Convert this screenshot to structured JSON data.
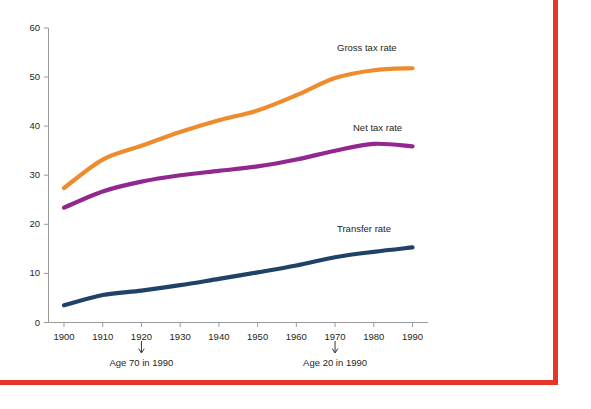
{
  "figure": {
    "cropped_title_fragment": "",
    "frame_color": "#e8352a",
    "background_color": "#ffffff"
  },
  "chart_data": {
    "type": "line",
    "title": "",
    "xlabel": "",
    "ylabel": "",
    "xlim": [
      1896,
      1994
    ],
    "ylim": [
      0,
      60
    ],
    "grid": false,
    "legend_position": "inline-right-of-line",
    "x": [
      1900,
      1910,
      1920,
      1930,
      1940,
      1950,
      1960,
      1970,
      1980,
      1990
    ],
    "xticklabels": [
      "1900",
      "1910",
      "1920",
      "1930",
      "1940",
      "1950",
      "1960",
      "1970",
      "1980",
      "1990"
    ],
    "yticks": [
      0,
      10,
      20,
      30,
      40,
      50,
      60
    ],
    "yticklabels": [
      "0",
      "10",
      "20",
      "30",
      "40",
      "50",
      "60"
    ],
    "series": [
      {
        "name": "Gross tax rate",
        "color": "#ee8b2d",
        "values": [
          27.4,
          33.2,
          36.0,
          38.8,
          41.2,
          43.2,
          46.3,
          49.8,
          51.4,
          51.8
        ]
      },
      {
        "name": "Net tax rate",
        "color": "#92278f",
        "values": [
          23.4,
          26.7,
          28.7,
          30.0,
          30.9,
          31.8,
          33.2,
          35.0,
          36.4,
          35.9
        ]
      },
      {
        "name": "Transfer rate",
        "color": "#1f4266",
        "values": [
          3.5,
          5.6,
          6.5,
          7.6,
          8.9,
          10.2,
          11.6,
          13.3,
          14.4,
          15.3
        ]
      }
    ],
    "annotations": [
      {
        "text": "Age 70 in 1990",
        "x": 1920
      },
      {
        "text": "Age 20 in 1990",
        "x": 1970
      }
    ]
  },
  "labels": {
    "gross": "Gross tax rate",
    "net": "Net tax rate",
    "transfer": "Transfer rate",
    "annot_age70": "Age 70 in 1990",
    "annot_age20": "Age 20 in 1990",
    "y0": "0",
    "y10": "10",
    "y20": "20",
    "y30": "30",
    "y40": "40",
    "y50": "50",
    "y60": "60",
    "x1900": "1900",
    "x1910": "1910",
    "x1920": "1920",
    "x1930": "1930",
    "x1940": "1940",
    "x1950": "1950",
    "x1960": "1960",
    "x1970": "1970",
    "x1980": "1980",
    "x1990": "1990"
  }
}
